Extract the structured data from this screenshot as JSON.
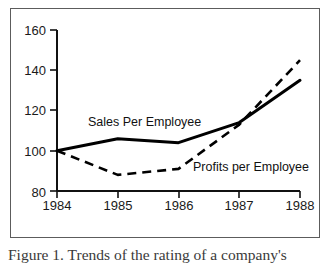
{
  "figure": {
    "caption": "Figure 1. Trends of the rating of a company's",
    "frame_color": "#5c5c5c",
    "background": "#ffffff"
  },
  "chart_data": {
    "type": "line",
    "title": "",
    "xlabel": "",
    "ylabel": "",
    "x": [
      "1984",
      "1985",
      "1986",
      "1987",
      "1988"
    ],
    "categories": [
      "1984",
      "1985",
      "1986",
      "1987",
      "1988"
    ],
    "xticklabels": [
      "1984",
      "1985",
      "1986",
      "1987",
      "1988"
    ],
    "yticklabels": [
      "80",
      "100",
      "120",
      "140",
      "160"
    ],
    "yticks": [
      80,
      100,
      120,
      140,
      160
    ],
    "ylim": [
      80,
      160
    ],
    "grid": false,
    "legend": "inline-annotations",
    "series": [
      {
        "name": "Sales Per Employee",
        "values": [
          100,
          106,
          104,
          114,
          135
        ],
        "style": "solid",
        "color": "#000000",
        "label_text": "Sales Per Employee"
      },
      {
        "name": "Profits per Employee",
        "values": [
          100,
          88,
          91,
          113,
          145
        ],
        "style": "dashed",
        "color": "#000000",
        "label_text": "Profits per Employee"
      }
    ],
    "annotations": [
      {
        "text": "Sales Per Employee",
        "x": 1985.25,
        "y": 118
      },
      {
        "text": "Profits per Employee",
        "x": 1986.95,
        "y": 95
      }
    ]
  }
}
